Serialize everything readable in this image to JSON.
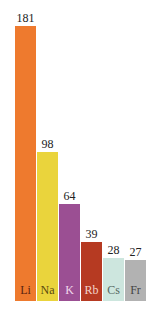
{
  "chart_data": {
    "type": "bar",
    "title": "",
    "xlabel": "",
    "ylabel": "",
    "categories": [
      "Li",
      "Na",
      "K",
      "Rb",
      "Cs",
      "Fr"
    ],
    "values": [
      181,
      98,
      64,
      39,
      28,
      27
    ],
    "colors": [
      "#ee7a2e",
      "#ead43c",
      "#9b4f93",
      "#b63a22",
      "#cde6de",
      "#b2b2b2"
    ],
    "label_colors": [
      "#5a2410",
      "#5a4a10",
      "#f0d8ec",
      "#f3d2c8",
      "#556660",
      "#444444"
    ],
    "ylim": [
      0,
      181
    ],
    "grid": false,
    "legend": "none",
    "data_labels": true
  }
}
